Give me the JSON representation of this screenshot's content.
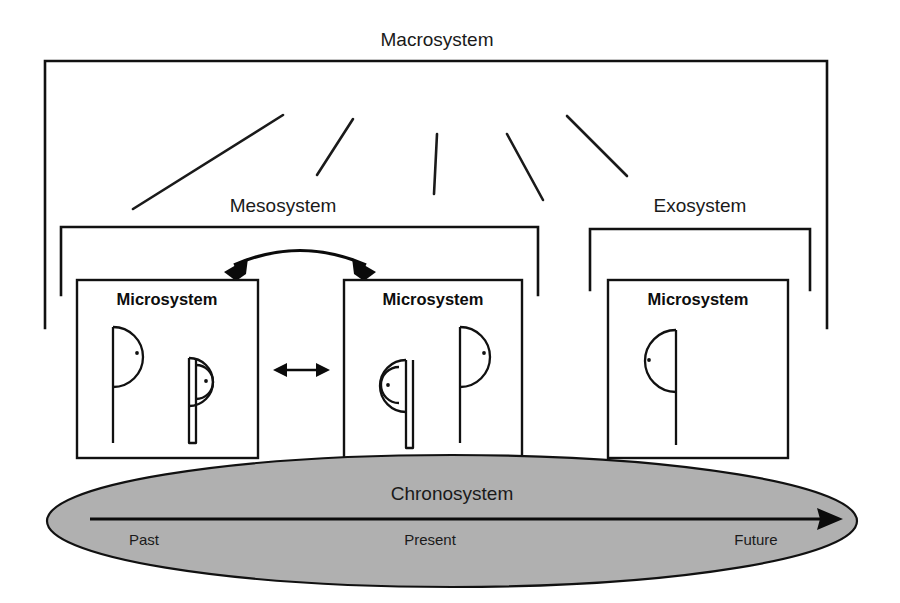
{
  "diagram": {
    "background_color": "#ffffff",
    "line_color": "#111111",
    "chronosystem_fill": "#b0b0b0",
    "layers": {
      "macrosystem": {
        "label": "Macrosystem"
      },
      "mesosystem": {
        "label": "Mesosystem"
      },
      "exosystem": {
        "label": "Exosystem"
      },
      "chronosystem": {
        "label": "Chronosystem"
      }
    },
    "microsystems": [
      {
        "label": "Microsystem",
        "figures": 2
      },
      {
        "label": "Microsystem",
        "figures": 2
      },
      {
        "label": "Microsystem",
        "figures": 1
      }
    ],
    "timeline": {
      "past_label": "Past",
      "present_label": "Present",
      "future_label": "Future",
      "direction": "left-to-right"
    },
    "connectors": {
      "mesosystem_curved_arrow": "bidirectional",
      "microsystem_link_arrow": "bidirectional",
      "macrosystem_rays": 5
    }
  }
}
